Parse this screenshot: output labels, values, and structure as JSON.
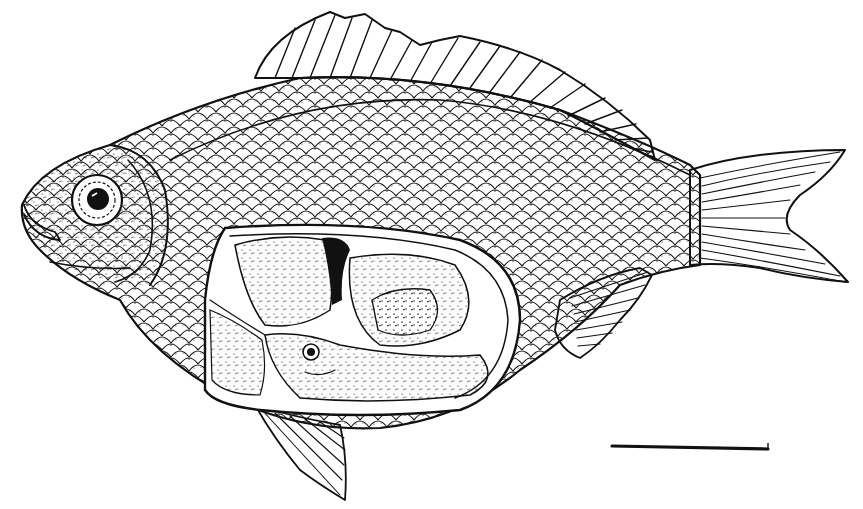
{
  "figure": {
    "subject": "Fish illustration, lateral view with abdominal cutaway",
    "style": "black ink stipple/line drawing on white",
    "colors": {
      "ink": "#111111",
      "background": "#ffffff"
    },
    "parts": [
      {
        "name": "head",
        "label": "Head with eye"
      },
      {
        "name": "dorsal-fin",
        "label": "Dorsal fin"
      },
      {
        "name": "caudal-fin",
        "label": "Forked caudal fin"
      },
      {
        "name": "anal-fin",
        "label": "Anal fin"
      },
      {
        "name": "pelvic-fin",
        "label": "Pelvic fin"
      },
      {
        "name": "body-scales",
        "label": "Scaled body"
      },
      {
        "name": "abdominal-cutaway",
        "label": "Opened body cavity showing developing embryo"
      }
    ],
    "scale_bar": {
      "visible": true,
      "label": ""
    }
  }
}
